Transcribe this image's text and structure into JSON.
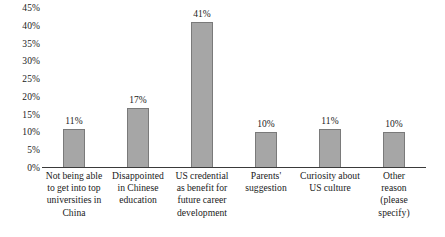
{
  "chart_data": {
    "type": "bar",
    "title": "",
    "subtitle": "",
    "xlabel": "",
    "ylabel": "",
    "ylim": [
      0,
      45
    ],
    "ytick_labels": [
      "45%",
      "40%",
      "35%",
      "30%",
      "25%",
      "20%",
      "15%",
      "10%",
      "5%",
      "0%"
    ],
    "ytick_values": [
      45,
      40,
      35,
      30,
      25,
      20,
      15,
      10,
      5,
      0
    ],
    "grid": false,
    "legend": false,
    "legend_position": "none",
    "categories": [
      "Not being able to get into top universities in China",
      "Disappointed in Chinese education",
      "US credential as benefit for future career development",
      "Parents' suggestion",
      "Curiosity about US culture",
      "Other reason (please specify)"
    ],
    "category_lines": [
      [
        "Not being able",
        "to get into top",
        "universities in",
        "China"
      ],
      [
        "Disappointed",
        "in Chinese",
        "education"
      ],
      [
        "US credential",
        "as benefit for",
        "future career",
        "development"
      ],
      [
        "Parents'",
        "suggestion"
      ],
      [
        "Curiosity about",
        "US culture"
      ],
      [
        "Other",
        "reason",
        "(please",
        "specify)"
      ]
    ],
    "values": [
      11,
      17,
      41,
      10,
      11,
      10
    ],
    "data_labels": [
      "11%",
      "17%",
      "41%",
      "10%",
      "11%",
      "10%"
    ],
    "colors": {
      "bar_fill": "#a6a6a6",
      "bar_stroke": "#7a7a7a",
      "axis": "#3a3a3a",
      "text": "#1a1a1a",
      "background": "#ffffff"
    }
  }
}
